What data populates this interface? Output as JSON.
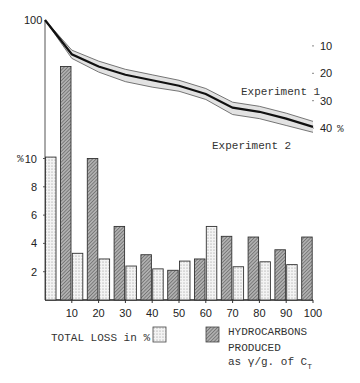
{
  "chart_data": {
    "type": "bar",
    "title": "",
    "xlabel": "",
    "ylabel": "%",
    "x_ticks": [
      "10",
      "20",
      "30",
      "40",
      "50",
      "60",
      "70",
      "80",
      "90",
      "100"
    ],
    "y_ticks_left": [
      "2",
      "4",
      "6",
      "8",
      "10"
    ],
    "y_left_unit": "%",
    "y_top_label": "100",
    "ylim": [
      0,
      17
    ],
    "xlim": [
      0,
      100
    ],
    "groups": [
      "0-10",
      "10-20",
      "20-30",
      "30-40",
      "40-50",
      "50-60",
      "60-70",
      "70-80",
      "80-90",
      "90-100"
    ],
    "series": [
      {
        "name": "TOTAL LOSS in %",
        "pattern": "dotted",
        "values": [
          10.1,
          3.3,
          2.9,
          2.4,
          2.2,
          2.75,
          5.2,
          2.35,
          2.7,
          2.5
        ]
      },
      {
        "name": "HYDROCARBONS PRODUCED as γ/g. of C_T",
        "pattern": "hatched",
        "values": [
          16.5,
          10.0,
          5.2,
          3.2,
          2.1,
          2.9,
          4.5,
          4.45,
          3.55,
          4.45
        ]
      }
    ],
    "line_overlay": {
      "type": "line",
      "description": "Cumulative loss curve with band between two experiments",
      "y_right_ticks": [
        "10",
        "20",
        "30",
        "40"
      ],
      "y_right_unit": "%",
      "y_right_range": [
        0,
        40
      ],
      "x": [
        0,
        10,
        20,
        30,
        40,
        50,
        60,
        70,
        80,
        90,
        100
      ],
      "series": [
        {
          "name": "Experiment 1",
          "values": [
            0,
            11,
            15,
            18,
            20,
            22,
            25,
            30,
            31.5,
            34,
            37
          ]
        },
        {
          "name": "Experiment 2",
          "values": [
            0,
            14,
            19,
            22.5,
            24.5,
            26,
            29,
            34.5,
            36,
            38.5,
            41
          ]
        }
      ],
      "center_values": [
        0,
        12.5,
        17,
        20,
        22,
        24,
        27,
        32,
        33.5,
        36,
        39
      ],
      "annotations": [
        "Experiment 1",
        "Experiment 2"
      ]
    },
    "legend": {
      "position": "bottom",
      "entries": [
        {
          "label": "TOTAL LOSS in %",
          "pattern": "dotted"
        },
        {
          "label_lines": [
            "HYDROCARBONS",
            "PRODUCED",
            "as γ/g. of C"
          ],
          "subscript": "T",
          "pattern": "hatched"
        }
      ]
    },
    "grid": false
  },
  "labels": {
    "top_left": "100",
    "left_unit": "%",
    "right_unit": "%",
    "exp1": "Experiment 1",
    "exp2": "Experiment 2",
    "legend_loss": "TOTAL LOSS in %",
    "legend_hc_1": "HYDROCARBONS",
    "legend_hc_2": "PRODUCED",
    "legend_hc_3": "as γ/g. of C",
    "legend_hc_sub": "T"
  },
  "colors": {
    "ink": "#222222",
    "band": "#e2e2e2",
    "dot_fill": "#f2f2f2",
    "hatch_fill": "#9a9a9a"
  }
}
